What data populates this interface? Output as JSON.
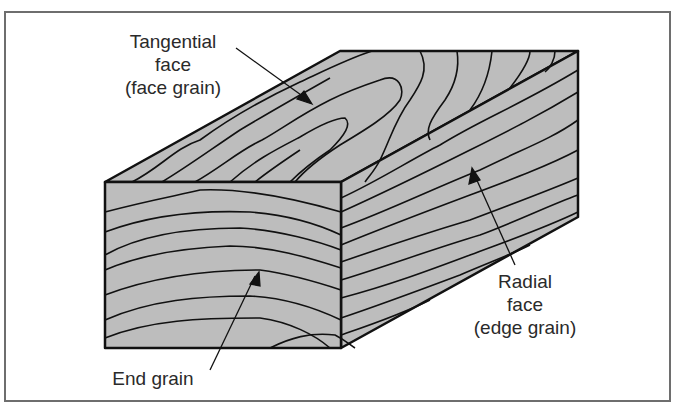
{
  "diagram": {
    "fill_color": "#bdbdbd",
    "line_color": "#111111",
    "frame_color": "#6e6e6e",
    "labels": [
      {
        "id": "tangential",
        "text": "Tangential\nface\n(face grain)",
        "points_to": "top face"
      },
      {
        "id": "radial",
        "text": "Radial\nface\n(edge grain)",
        "points_to": "right side face"
      },
      {
        "id": "end",
        "text": "End grain",
        "points_to": "front end face"
      }
    ]
  }
}
